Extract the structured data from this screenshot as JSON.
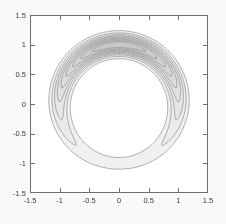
{
  "figure": {
    "background": "#f9f9f7",
    "plot_background": "#fefefe"
  },
  "chart_data": {
    "type": "contour",
    "title": "",
    "xlabel": "",
    "ylabel": "",
    "xlim": [
      -1.5,
      1.5
    ],
    "ylim": [
      -1.5,
      1.5
    ],
    "xticks": [
      -1.5,
      -1,
      -0.5,
      0,
      0.5,
      1,
      1.5
    ],
    "xtick_labels": [
      "-1.5",
      "-1",
      "-0.5",
      "0",
      "0.5",
      "1",
      "1.5"
    ],
    "yticks": [
      -1.5,
      -1,
      -0.5,
      0,
      0.5,
      1,
      1.5
    ],
    "ytick_labels": [
      "-1.5",
      "-1",
      "-0.5",
      "0",
      "0.5",
      "1",
      "1.5"
    ],
    "grid": false,
    "legend": "none",
    "levels": [
      0.1,
      0.2,
      0.3,
      0.4,
      0.5,
      0.6,
      0.7,
      0.8,
      0.9
    ],
    "model": {
      "formula": "f(x,y) = exp(kappa*(cos(theta - peak)-1)) * exp(-(r - ring_radius)^2 / (2*sigma^2))",
      "ring_radius": 1.0,
      "radial_sigma": 0.11,
      "angular_kappa": 0.95,
      "peak_angle_deg": 90
    },
    "annulus_extents": {
      "outer_radius_top": 1.24,
      "inner_radius_top": 0.76,
      "outer_radius_bottom": 1.1,
      "inner_radius_bottom": 0.88
    },
    "style": {
      "line_color": "#8d8d8d",
      "axis_color": "#6f6f6f",
      "label_color": "#3a3a3a",
      "fill_gray_start": 245,
      "fill_gray_step": 5
    }
  }
}
